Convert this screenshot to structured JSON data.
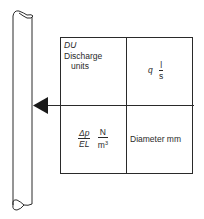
{
  "diagram": {
    "title": "",
    "pipe": {
      "label": ""
    },
    "arrow": {
      "direction": "left"
    },
    "cells": {
      "top_left": {
        "abbr": "DU",
        "label_line1": "Discharge",
        "label_line2": "units"
      },
      "top_right": {
        "symbol": "q",
        "unit_num": "l",
        "unit_den": "s"
      },
      "bottom_left": {
        "sym_num": "Δp",
        "sym_den": "EL",
        "unit_num": "N",
        "unit_den_base": "m",
        "unit_den_exp": "3"
      },
      "bottom_right": {
        "label": "Diameter mm"
      }
    },
    "colors": {
      "line": "#2a2a2a",
      "background": "#ffffff"
    }
  }
}
